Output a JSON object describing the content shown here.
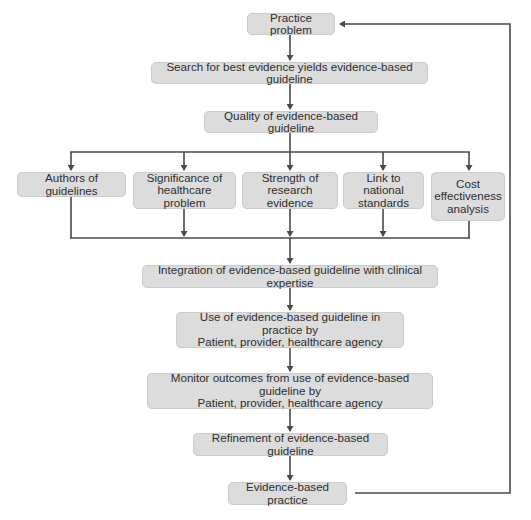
{
  "diagram": {
    "type": "flowchart",
    "colors": {
      "node_fill": "#dcdcdc",
      "node_border": "#cbcbcb",
      "connector": "#4a4a4a",
      "text": "#2e2e2e",
      "background": "#ffffff"
    },
    "nodes": {
      "practice_problem": "Practice problem",
      "search": "Search for best evidence yields evidence-based guideline",
      "quality": "Quality of evidence-based guideline",
      "authors": "Authors of guidelines",
      "significance": "Significance of\nhealthcare problem",
      "strength": "Strength of\nresearch evidence",
      "link": "Link to national\nstandards",
      "cost": "Cost\neffectiveness\nanalysis",
      "integration": "Integration of evidence-based guideline with clinical expertise",
      "use": "Use of evidence-based guideline in practice by\nPatient, provider, healthcare agency",
      "monitor": "Monitor outcomes from use of evidence-based guideline by\nPatient, provider, healthcare agency",
      "refinement": "Refinement of evidence-based guideline",
      "ebp": "Evidence-based practice"
    },
    "edges": [
      {
        "from": "practice_problem",
        "to": "search"
      },
      {
        "from": "search",
        "to": "quality"
      },
      {
        "from": "quality",
        "to": "authors"
      },
      {
        "from": "quality",
        "to": "significance"
      },
      {
        "from": "quality",
        "to": "strength"
      },
      {
        "from": "quality",
        "to": "link"
      },
      {
        "from": "quality",
        "to": "cost"
      },
      {
        "from": "authors",
        "to": "integration"
      },
      {
        "from": "significance",
        "to": "integration"
      },
      {
        "from": "strength",
        "to": "integration"
      },
      {
        "from": "link",
        "to": "integration"
      },
      {
        "from": "cost",
        "to": "integration"
      },
      {
        "from": "integration",
        "to": "use"
      },
      {
        "from": "use",
        "to": "monitor"
      },
      {
        "from": "monitor",
        "to": "refinement"
      },
      {
        "from": "refinement",
        "to": "ebp"
      },
      {
        "from": "ebp",
        "to": "practice_problem",
        "type": "feedback-loop"
      }
    ]
  }
}
